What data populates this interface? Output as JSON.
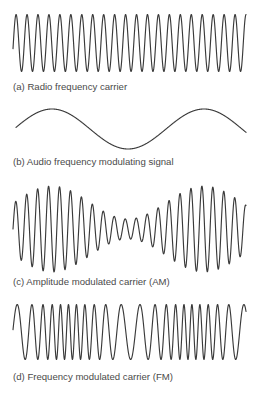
{
  "figure": {
    "line_color": "#3a3a3a",
    "caption_color": "#4a4a4a",
    "panels": [
      {
        "id": "a",
        "caption": "(a) Radio frequency carrier",
        "caption_top": 82,
        "wave": {
          "kind": "carrier",
          "x_start": 13,
          "x_end": 246,
          "center_y": 43,
          "amplitude": 28.5,
          "period": 10.95,
          "phase": -0.2
        }
      },
      {
        "id": "b",
        "caption": "(b) Audio frequency modulating signal",
        "caption_top": 157,
        "wave": {
          "kind": "audio",
          "x_start": 16,
          "x_end": 246,
          "center_y": 129,
          "amplitude": 20,
          "period": 152,
          "peak_x": 52
        }
      },
      {
        "id": "c",
        "caption": "(c) Amplitude modulated carrier (AM)",
        "caption_top": 277,
        "wave": {
          "kind": "am",
          "x_start": 13,
          "x_end": 246,
          "center_y": 229,
          "carrier_period": 10.95,
          "max_amplitude": 43,
          "min_amplitude": 10,
          "envelope_period": 152,
          "envelope_peak_x": 52,
          "phase": 0.0
        }
      },
      {
        "id": "d",
        "caption": "(d) Frequency modulated carrier (FM)",
        "caption_top": 372,
        "wave": {
          "kind": "fm",
          "x_start": 13,
          "x_end": 246,
          "center_y": 332,
          "amplitude": 27.5,
          "base_period": 11.2,
          "deviation": 0.42,
          "mod_period": 124,
          "mod_peak_x": 68
        }
      }
    ]
  }
}
